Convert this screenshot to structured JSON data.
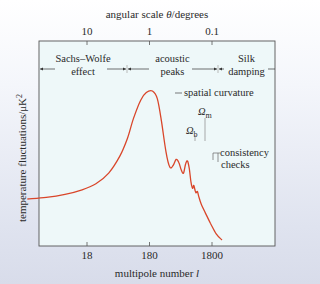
{
  "chart_data": {
    "type": "line",
    "title": "",
    "xlabel": "multipole number l",
    "xlabel_text": "multipole number ",
    "xlabel_var": "l",
    "ylabel": "temperature fluctuations/μK²",
    "ylabel_text": "temperature fluctuations/μK",
    "ylabel_sup": "2",
    "top_axis_label_text": "angular scale ",
    "top_axis_label_var": "θ",
    "top_axis_label_unit": "/degrees",
    "x_scale": "log",
    "x_ticks": [
      "18",
      "180",
      "1800"
    ],
    "x_tick_values": [
      18,
      180,
      1800
    ],
    "top_ticks": [
      "10",
      "1",
      "0.1"
    ],
    "top_tick_values": [
      10,
      1,
      0.1
    ],
    "xlim": [
      2,
      4000
    ],
    "ylim": [
      0,
      100
    ],
    "grid": false,
    "regions": [
      {
        "line1": "Sachs–Wolfe",
        "line2": "effect",
        "range": [
          2,
          100
        ]
      },
      {
        "line1": "acoustic",
        "line2": "peaks",
        "range": [
          100,
          1000
        ]
      },
      {
        "line1": "Silk",
        "line2": "damping",
        "range": [
          1000,
          4000
        ]
      }
    ],
    "series": [
      {
        "name": "CMB power spectrum",
        "color": "#d9462a",
        "points": [
          [
            2,
            27
          ],
          [
            4,
            28
          ],
          [
            8,
            30
          ],
          [
            15,
            33
          ],
          [
            25,
            37
          ],
          [
            40,
            44
          ],
          [
            60,
            55
          ],
          [
            80,
            67
          ],
          [
            100,
            80
          ],
          [
            130,
            92
          ],
          [
            160,
            97
          ],
          [
            200,
            98
          ],
          [
            240,
            93
          ],
          [
            280,
            78
          ],
          [
            330,
            58
          ],
          [
            380,
            48
          ],
          [
            430,
            49
          ],
          [
            480,
            53
          ],
          [
            530,
            51
          ],
          [
            580,
            46
          ],
          [
            630,
            44
          ],
          [
            680,
            50
          ],
          [
            730,
            52
          ],
          [
            780,
            47
          ],
          [
            830,
            38
          ],
          [
            880,
            34
          ],
          [
            920,
            36
          ],
          [
            960,
            33
          ],
          [
            1000,
            31
          ],
          [
            1050,
            32
          ],
          [
            1100,
            29
          ],
          [
            1200,
            24
          ],
          [
            1400,
            18
          ],
          [
            1700,
            11
          ],
          [
            2100,
            4
          ],
          [
            2600,
            0
          ]
        ]
      }
    ],
    "annotations": [
      {
        "text": "spatial curvature",
        "target": "first peak"
      },
      {
        "text": "Ω",
        "sub": "b",
        "target": "second peak"
      },
      {
        "text": "Ω",
        "sub": "m",
        "target": "third peak"
      },
      {
        "text_line1": "consistency",
        "text_line2": "checks",
        "target": "higher peaks"
      }
    ]
  }
}
